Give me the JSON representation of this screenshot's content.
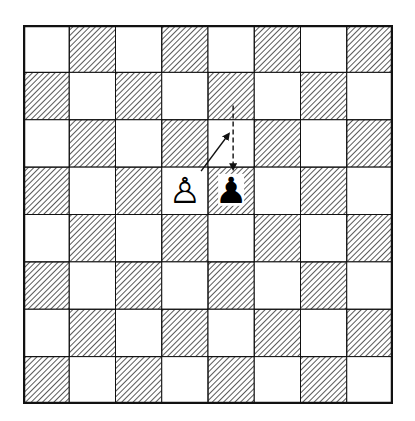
{
  "diagram": {
    "type": "chess-board",
    "title": "",
    "rows": 8,
    "cols": 8,
    "colors": {
      "light_square": "#ffffff",
      "dark_square_hatch": "#222222",
      "border": "#111111",
      "background": "#ffffff"
    },
    "pieces": [
      {
        "name": "white-pawn",
        "color": "white",
        "type": "pawn",
        "row": 3,
        "col": 3,
        "glyph": "♙"
      },
      {
        "name": "black-pawn",
        "color": "black",
        "type": "pawn",
        "row": 3,
        "col": 4,
        "glyph": "♟"
      }
    ],
    "arrows": [
      {
        "name": "black-pawn-double-step-arrow",
        "style": "dashed",
        "from": {
          "row": 1,
          "col": 4
        },
        "to": {
          "row": 3,
          "col": 4
        }
      },
      {
        "name": "en-passant-capture-arrow",
        "style": "solid",
        "from": {
          "row": 3,
          "col": 3
        },
        "to": {
          "row": 2,
          "col": 4
        }
      }
    ]
  }
}
